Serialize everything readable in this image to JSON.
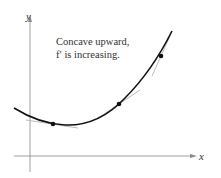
{
  "axes": {
    "x_label": "x",
    "y_label": "y"
  },
  "annotation": {
    "line1": "Concave upward,",
    "line2": "f′ is increasing."
  },
  "points": [
    {
      "x": 53,
      "y": 124
    },
    {
      "x": 119,
      "y": 104
    },
    {
      "x": 161,
      "y": 56
    }
  ]
}
